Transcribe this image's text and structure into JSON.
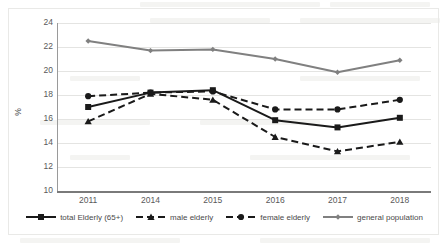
{
  "chart_data": {
    "type": "line",
    "title": "",
    "subtitle": "",
    "xlabel": "",
    "ylabel": "%",
    "categories": [
      "2011",
      "2014",
      "2015",
      "2016",
      "2017",
      "2018"
    ],
    "ylim": [
      10,
      24
    ],
    "yticks": [
      24,
      22,
      20,
      18,
      16,
      14,
      12,
      10
    ],
    "grid": true,
    "legend_position": "bottom",
    "series": [
      {
        "name": "total Elderly (65+)",
        "values": [
          17.0,
          18.2,
          18.4,
          15.9,
          15.3,
          16.1
        ],
        "color": "#1a1a1a",
        "line_style": "solid",
        "marker": "square"
      },
      {
        "name": "male elderly",
        "values": [
          15.8,
          18.1,
          17.6,
          14.5,
          13.3,
          14.1
        ],
        "color": "#1a1a1a",
        "line_style": "dashed",
        "marker": "triangle"
      },
      {
        "name": "female elderly",
        "values": [
          17.9,
          18.2,
          18.3,
          16.8,
          16.8,
          17.6
        ],
        "color": "#1a1a1a",
        "line_style": "dashed",
        "marker": "circle"
      },
      {
        "name": "general population",
        "values": [
          22.5,
          21.7,
          21.8,
          21.0,
          19.9,
          20.9
        ],
        "color": "#808080",
        "line_style": "solid",
        "marker": "diamond"
      }
    ]
  },
  "legend": {
    "items": [
      {
        "label": "total Elderly (65+)"
      },
      {
        "label": "male elderly"
      },
      {
        "label": "female elderly"
      },
      {
        "label": "general population"
      }
    ]
  },
  "background_artifacts": {
    "texts": [
      "Table 1. Share of population",
      "elderly population",
      "poverty rate",
      "by sex",
      "Source",
      "statistics"
    ]
  }
}
